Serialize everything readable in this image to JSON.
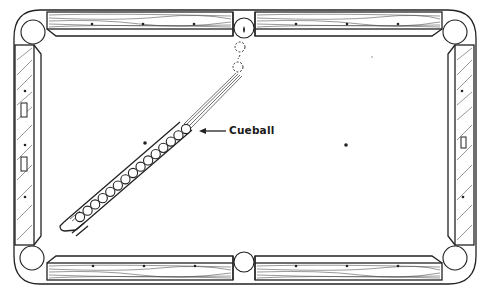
{
  "diagram": {
    "labels": {
      "cueball": "Cueball"
    },
    "colors": {
      "ink": "#222222",
      "background": "#ffffff"
    },
    "table": {
      "pockets": [
        {
          "name": "top-left",
          "cx": 33,
          "cy": 32,
          "r": 12
        },
        {
          "name": "top-center",
          "cx": 244,
          "cy": 28,
          "r": 10
        },
        {
          "name": "top-right",
          "cx": 455,
          "cy": 32,
          "r": 12
        },
        {
          "name": "bottom-left",
          "cx": 32,
          "cy": 258,
          "r": 12
        },
        {
          "name": "bottom-center",
          "cx": 244,
          "cy": 262,
          "r": 10
        },
        {
          "name": "bottom-right",
          "cx": 455,
          "cy": 258,
          "r": 12
        }
      ],
      "spots": [
        {
          "x": 145,
          "y": 143
        },
        {
          "x": 346,
          "y": 145
        }
      ],
      "rail_sights_per_long_rail": 3,
      "rail_sights_per_short_rail": 3
    },
    "ball_row": {
      "count": 15,
      "start": {
        "x": 186,
        "y": 129
      },
      "end": {
        "x": 80,
        "y": 217
      },
      "radius": 4.6
    },
    "ghost_balls": [
      {
        "cx": 240,
        "cy": 48,
        "r": 5
      },
      {
        "cx": 238,
        "cy": 67,
        "r": 5
      }
    ]
  }
}
